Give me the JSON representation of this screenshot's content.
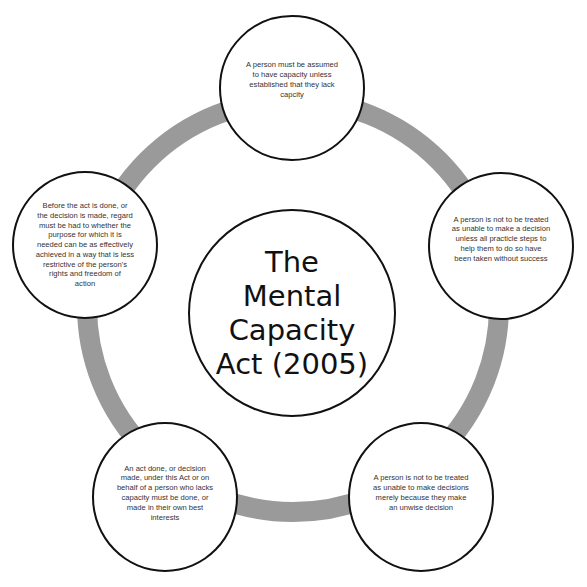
{
  "diagram": {
    "type": "cycle",
    "ring_color": "#9a9a9a",
    "border_color": "#111111",
    "center": {
      "title": "The Mental Capacity Act (2005)",
      "lines": [
        "The",
        "Mental",
        "Capacity",
        "Act (2005)"
      ]
    },
    "principles": [
      {
        "position": "top",
        "lines": [
          "A person must be assumed",
          "to have capacity unless",
          "established that they lack",
          "capcity"
        ]
      },
      {
        "position": "right",
        "lines": [
          "A person is not to be treated",
          "as unable to make a decision",
          "unless all practicle steps to",
          "help them to do so have",
          "been taken without success"
        ]
      },
      {
        "position": "bottom-right",
        "lines": [
          "A person is not to be treated",
          "as unable to make decisions",
          "merely because they make",
          "an unwise decision"
        ]
      },
      {
        "position": "bottom-left",
        "lines": [
          "An act done, or decision",
          "made, under this Act or on",
          "behalf of a person who lacks",
          "capacity must be done, or",
          "made in their own best",
          "interests"
        ]
      },
      {
        "position": "left",
        "lines": [
          "Before the act is done, or",
          "the decision is made, regard",
          "must be had to whether the",
          "purpose for which it is",
          "needed can be as effectively",
          "achieved in a way that is less",
          "restrictive of the person's",
          "rights and freedom of",
          "action"
        ]
      }
    ]
  }
}
